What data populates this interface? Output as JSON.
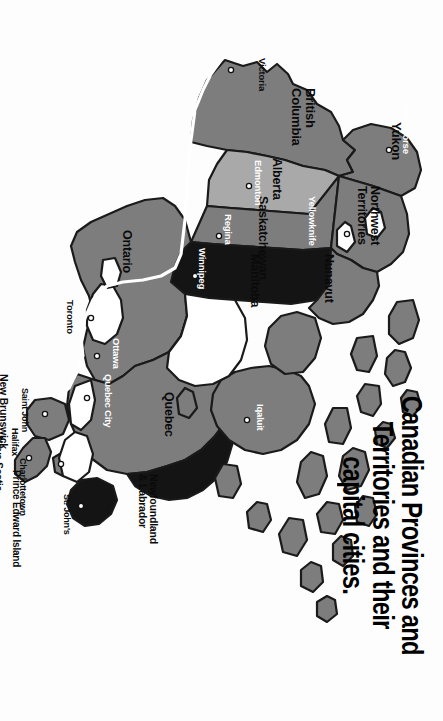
{
  "title": {
    "line1": "Canadian Provinces and",
    "line2": "Territories and their",
    "line3": "capital cities.",
    "full": "Canadian Provinces and Territories and their capital cities."
  },
  "map": {
    "name": "map-of-canada",
    "orientation": "rotated-90-clockwise",
    "background_color": "#fdfdfd",
    "outline_color": "#1a1a1a",
    "fills": {
      "medium_gray": "#7d7d7d",
      "light_gray": "#a9a9a9",
      "dark_gray": "#3a3a3a",
      "near_black": "#141414",
      "water": "#ffffff"
    },
    "border_line_color": "#ffffff"
  },
  "regions": [
    {
      "name": "Yukon",
      "label": "Yukon",
      "capital": "Whitehorse",
      "fill": "#7d7d7d",
      "label_color": "dark",
      "capital_color": "light"
    },
    {
      "name": "Northwest Territories",
      "label": "Northwest Territories",
      "capital": "Yellowknife",
      "fill": "#7d7d7d",
      "label_color": "dark",
      "capital_color": "light"
    },
    {
      "name": "Nunavut",
      "label": "Nunavut",
      "capital": "Iqaluit",
      "fill": "#7d7d7d",
      "label_color": "dark",
      "capital_color": "light"
    },
    {
      "name": "British Columbia",
      "label": "British Columbia",
      "capital": "Victoria",
      "fill": "#7d7d7d",
      "label_color": "dark",
      "capital_color": "dark"
    },
    {
      "name": "Alberta",
      "label": "Alberta",
      "capital": "Edmonton",
      "fill": "#a9a9a9",
      "label_color": "dark",
      "capital_color": "light"
    },
    {
      "name": "Saskatchewan",
      "label": "Saskatchewan",
      "capital": "Regina",
      "fill": "#7d7d7d",
      "label_color": "dark",
      "capital_color": "light"
    },
    {
      "name": "Manitoba",
      "label": "Manitoba",
      "capital": "Winnipeg",
      "fill": "#141414",
      "label_color": "dark",
      "capital_color": "light"
    },
    {
      "name": "Ontario",
      "label": "Ontario",
      "capital": "Toronto",
      "fill": "#7d7d7d",
      "label_color": "dark",
      "capital_color": "dark"
    },
    {
      "name": "Quebec",
      "label": "Quebec",
      "capital": "Quebec City",
      "fill": "#7d7d7d",
      "label_color": "dark",
      "capital_color": "light"
    },
    {
      "name": "New Brunswick",
      "label": "New Brunswick",
      "capital": "Saint John",
      "fill": "#7d7d7d",
      "label_color": "dark",
      "capital_color": "dark"
    },
    {
      "name": "Nova Scotia",
      "label": "Nova Scotia",
      "capital": "Halifax",
      "fill": "#7d7d7d",
      "label_color": "dark",
      "capital_color": "dark"
    },
    {
      "name": "Prince Edward Island",
      "label": "Prince Edward Island",
      "capital": "Charlottetown",
      "fill": "#7d7d7d",
      "label_color": "dark",
      "capital_color": "dark"
    },
    {
      "name": "Newfoundland & Labrador",
      "label": "Newfoundland\n& Labrador",
      "capital": "St. John's",
      "fill": "#141414",
      "label_color": "dark",
      "capital_color": "dark"
    }
  ],
  "region_labels": {
    "yukon": "Yukon",
    "northwest_territories_line1": "Northwest",
    "northwest_territories_line2": "Territories",
    "nunavut": "Nunavut",
    "british_columbia_line1": "British",
    "british_columbia_line2": "Columbia",
    "alberta": "Alberta",
    "saskatchewan": "Saskatchewan",
    "manitoba": "Manitoba",
    "ontario": "Ontario",
    "quebec": "Quebec",
    "new_brunswick": "New Brunswick",
    "nova_scotia": "Nova Scotia",
    "prince_edward_island": "Prince Edward Island",
    "newfoundland_line1": "Newfoundland",
    "newfoundland_line2": "& Labrador"
  },
  "city_labels": {
    "whitehorse": "Whitehorse",
    "yellowknife": "Yellowknife",
    "iqaluit": "Iqaluit",
    "victoria": "Victoria",
    "edmonton": "Edmonton",
    "regina": "Regina",
    "winnipeg": "Winnipeg",
    "toronto": "Toronto",
    "ottawa": "Ottawa",
    "quebec_city": "Quebec City",
    "saint_john": "Saint John",
    "halifax": "Halifax",
    "charlottetown": "Charlottetown",
    "st_johns": "St. John's"
  }
}
